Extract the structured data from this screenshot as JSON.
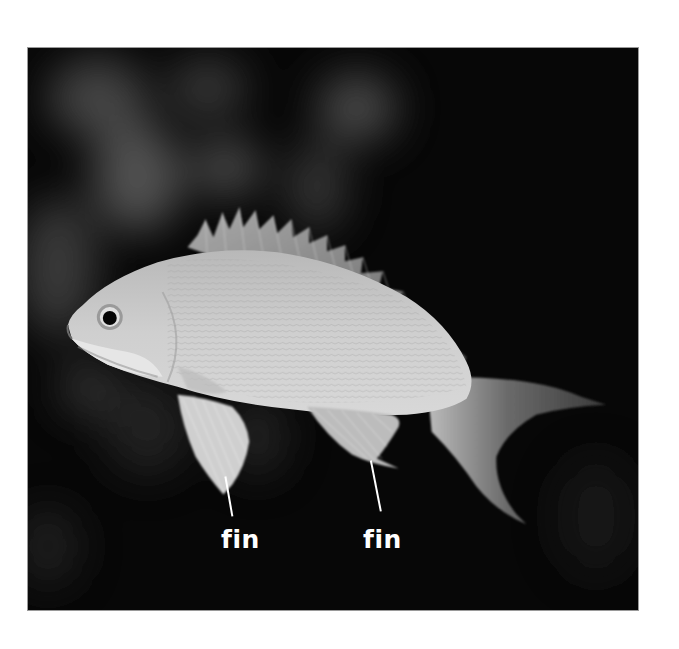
{
  "image": {
    "subject": "fish",
    "description": "Grayscale photograph of a fish against a dark blurred background, with two fins labeled",
    "colors": {
      "background": "#070707",
      "frame_border": "#9a9a9a",
      "label_text": "#ffffff",
      "page": "#ffffff"
    }
  },
  "labels": [
    {
      "text": "fin",
      "target": "pelvic fin",
      "x": 221,
      "y": 527
    },
    {
      "text": "fin",
      "target": "anal fin",
      "x": 363,
      "y": 527
    }
  ]
}
